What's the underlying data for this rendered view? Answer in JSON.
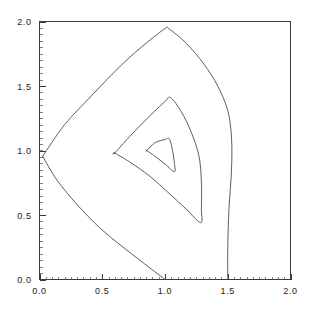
{
  "chart_data": {
    "type": "line",
    "subtype": "contour",
    "title": "",
    "xlabel": "",
    "ylabel": "",
    "xlim": [
      0.0,
      2.0
    ],
    "ylim": [
      0.0,
      2.0
    ],
    "grid": false,
    "legend": null,
    "x_ticks": [
      0.0,
      0.5,
      1.0,
      1.5,
      2.0
    ],
    "y_ticks": [
      0.0,
      0.5,
      1.0,
      1.5,
      2.0
    ],
    "x_tick_labels": [
      "0.0",
      "0.5",
      "1.0",
      "1.5",
      "2.0"
    ],
    "y_tick_labels": [
      "0.0",
      "0.5",
      "1.0",
      "1.5",
      "2.0"
    ],
    "minor_ticks_per_interval": 10,
    "line_color": "#4b4b4b",
    "axis_color": "#3a3a3a",
    "background_color": "#ffffff",
    "series": [
      {
        "name": "outer-contour",
        "closed": false,
        "points": [
          [
            0.025,
            0.955
          ],
          [
            0.2,
            1.2
          ],
          [
            0.42,
            1.43
          ],
          [
            0.66,
            1.67
          ],
          [
            0.86,
            1.84
          ],
          [
            1.0,
            1.945
          ],
          [
            1.03,
            1.945
          ],
          [
            1.17,
            1.83
          ],
          [
            1.31,
            1.67
          ],
          [
            1.42,
            1.5
          ],
          [
            1.5,
            1.31
          ],
          [
            1.53,
            1.1
          ],
          [
            1.53,
            0.85
          ],
          [
            1.51,
            0.55
          ],
          [
            1.5,
            0.25
          ],
          [
            1.5,
            0.0
          ]
        ]
      },
      {
        "name": "outer-contour-lower-branch",
        "closed": false,
        "points": [
          [
            0.025,
            0.955
          ],
          [
            0.14,
            0.77
          ],
          [
            0.3,
            0.58
          ],
          [
            0.48,
            0.4
          ],
          [
            0.68,
            0.24
          ],
          [
            0.88,
            0.09
          ],
          [
            1.0,
            0.0
          ]
        ]
      },
      {
        "name": "middle-contour",
        "closed": true,
        "points": [
          [
            0.6,
            0.98
          ],
          [
            0.72,
            1.11
          ],
          [
            0.86,
            1.25
          ],
          [
            1.0,
            1.38
          ],
          [
            1.045,
            1.41
          ],
          [
            1.13,
            1.3
          ],
          [
            1.21,
            1.14
          ],
          [
            1.27,
            0.96
          ],
          [
            1.29,
            0.76
          ],
          [
            1.29,
            0.55
          ],
          [
            1.285,
            0.44
          ],
          [
            1.17,
            0.545
          ],
          [
            1.03,
            0.67
          ],
          [
            0.88,
            0.8
          ],
          [
            0.72,
            0.91
          ],
          [
            0.6,
            0.98
          ]
        ]
      },
      {
        "name": "inner-contour",
        "closed": true,
        "points": [
          [
            0.855,
            1.0
          ],
          [
            0.92,
            1.06
          ],
          [
            1.0,
            1.085
          ],
          [
            1.035,
            1.09
          ],
          [
            1.06,
            1.0
          ],
          [
            1.075,
            0.9
          ],
          [
            1.075,
            0.835
          ],
          [
            1.0,
            0.895
          ],
          [
            0.92,
            0.955
          ],
          [
            0.855,
            1.0
          ]
        ]
      }
    ]
  }
}
